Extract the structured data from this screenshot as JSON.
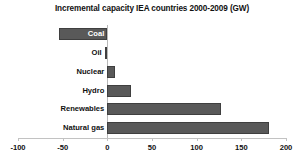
{
  "chart_data": {
    "type": "bar",
    "orientation": "horizontal",
    "title": "Incremental capacity IEA countries 2000-2009 (GW)",
    "xlabel": "",
    "ylabel": "",
    "categories": [
      "Coal",
      "Oil",
      "Nuclear",
      "Hydro",
      "Renewables",
      "Natural gas"
    ],
    "values": [
      -54,
      -3,
      9,
      26,
      127,
      181
    ],
    "xlim": [
      -100,
      200
    ],
    "xticks": [
      -100,
      -50,
      0,
      50,
      100,
      150,
      200
    ],
    "xtick_labels": [
      "-100",
      "-50",
      "0",
      "50",
      "100",
      "150",
      "200"
    ],
    "grid": false,
    "legend": false,
    "bar_color": "#595959",
    "bar_border_color": "#3f3f3f",
    "axis_color": "#c2c2c2",
    "background": "#ffffff",
    "label_color": "#111111",
    "label_color_inside": "#ffffff"
  }
}
